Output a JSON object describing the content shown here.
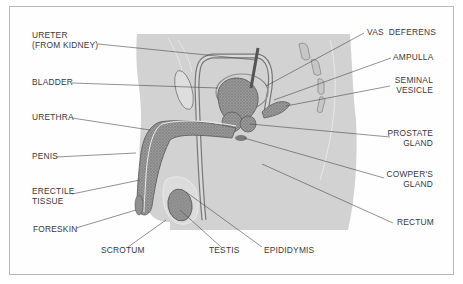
{
  "diagram": {
    "colors": {
      "body_fill": "#d2d2d2",
      "organ_fill": "#8a8a8a",
      "leader_line": "#4a4a4a",
      "text": "#3a3a3a",
      "frame": "#b8b8b8"
    },
    "labels_left": [
      {
        "id": "ureter",
        "line1": "URETER",
        "line2": "(FROM KIDNEY)"
      },
      {
        "id": "bladder",
        "line1": "BLADDER",
        "line2": ""
      },
      {
        "id": "urethra",
        "line1": "URETHRA",
        "line2": ""
      },
      {
        "id": "penis",
        "line1": "PENIS",
        "line2": ""
      },
      {
        "id": "erectile_tissue",
        "line1": "ERECTILE",
        "line2": "TISSUE"
      },
      {
        "id": "foreskin",
        "line1": "FORESKIN",
        "line2": ""
      }
    ],
    "labels_bottom": [
      {
        "id": "scrotum",
        "line1": "SCROTUM"
      },
      {
        "id": "testis",
        "line1": "TESTIS"
      },
      {
        "id": "epididymis",
        "line1": "EPIDIDYMIS"
      }
    ],
    "labels_right": [
      {
        "id": "vas_deferens",
        "line1": "VAS  DEFERENS",
        "line2": ""
      },
      {
        "id": "ampulla",
        "line1": "AMPULLA",
        "line2": ""
      },
      {
        "id": "seminal_vesicle",
        "line1": "SEMINAL",
        "line2": "VESICLE"
      },
      {
        "id": "prostate_gland",
        "line1": "PROSTATE",
        "line2": "GLAND"
      },
      {
        "id": "cowpers_gland",
        "line1": "COWPER'S",
        "line2": "GLAND"
      },
      {
        "id": "rectum",
        "line1": "RECTUM",
        "line2": ""
      }
    ]
  }
}
